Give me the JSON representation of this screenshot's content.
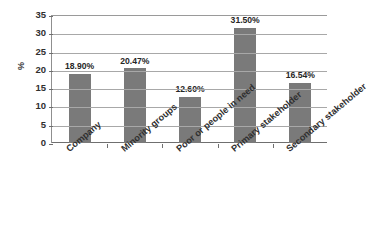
{
  "chart_data": {
    "type": "bar",
    "title": "",
    "subtitle": "",
    "xlabel": "",
    "ylabel": "%",
    "categories": [
      "Company",
      "Minority groups",
      "Poor or people in need",
      "Primary stakeholder",
      "Secondary stakeholder"
    ],
    "values": [
      18.9,
      20.47,
      12.6,
      31.5,
      16.54
    ],
    "data_labels": [
      "18.90%",
      "20.47%",
      "12.60%",
      "31.50%",
      "16.54%"
    ],
    "ylim": [
      0,
      35
    ],
    "ytick_step": 5,
    "ytick_labels": [
      "0",
      "5",
      "10",
      "15",
      "20",
      "25",
      "30",
      "35"
    ],
    "grid": "horizontal",
    "legend": "none",
    "bar_color": "#7a7a7a",
    "background_color": "#ffffff",
    "gridline_color": "#a8a8a8",
    "axis_color": "#6f6f6f"
  }
}
